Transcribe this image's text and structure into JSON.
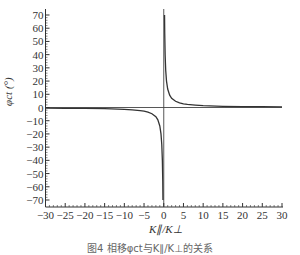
{
  "chart_data": {
    "type": "line",
    "title": "",
    "xlabel": "K∥/K⊥",
    "ylabel": "φct (°)",
    "xlim": [
      -30,
      30
    ],
    "ylim": [
      -70,
      70
    ],
    "xticks": [
      -30,
      -25,
      -20,
      -15,
      -10,
      -5,
      0,
      5,
      10,
      15,
      20,
      25,
      30
    ],
    "yticks": [
      70,
      60,
      50,
      40,
      30,
      20,
      10,
      0,
      -10,
      -20,
      -30,
      -40,
      -50,
      -60,
      -70
    ],
    "grid": false,
    "legend": null,
    "reference_lines": {
      "horizontal_at_y": 0,
      "vertical_at_x": 0
    },
    "series": [
      {
        "name": "φct",
        "x": [
          -30,
          -25,
          -20,
          -15,
          -10,
          -8,
          -6,
          -5,
          -4,
          -3,
          -2,
          -1.5,
          -1,
          -0.7,
          -0.5,
          -0.35,
          -0.25,
          -0.2,
          0.2,
          0.25,
          0.35,
          0.5,
          0.7,
          1,
          1.5,
          2,
          3,
          4,
          5,
          6,
          8,
          10,
          15,
          20,
          25,
          30
        ],
        "values": [
          -0.5,
          -0.6,
          -0.7,
          -0.9,
          -1.4,
          -1.8,
          -2.3,
          -2.8,
          -3.5,
          -4.7,
          -7,
          -9.3,
          -14,
          -20,
          -28,
          -40,
          -56,
          -70,
          70,
          56,
          40,
          28,
          20,
          14,
          9.3,
          7,
          4.7,
          3.5,
          2.8,
          2.3,
          1.8,
          1.4,
          0.9,
          0.7,
          0.6,
          0.5
        ]
      }
    ]
  },
  "caption": "图4  相移φct与K∥/K⊥的关系"
}
